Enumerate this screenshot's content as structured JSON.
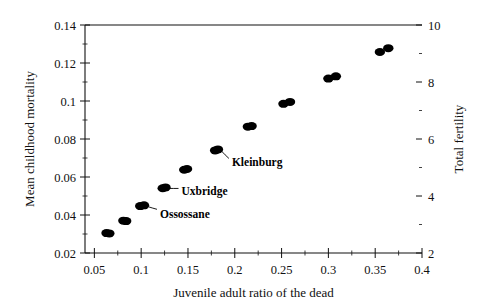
{
  "chart_data": {
    "type": "scatter",
    "title": "",
    "xlabel": "Juvenile adult ratio of the dead",
    "ylabel": "Mean childhood mortality",
    "y2label": "Total fertility",
    "xlim": [
      0.04,
      0.4
    ],
    "ylim": [
      0.02,
      0.14
    ],
    "y2lim": [
      2,
      10
    ],
    "grid": false,
    "legend": "none",
    "xticks": [
      "0.05",
      "0.1",
      "0.15",
      "0.2",
      "0.25",
      "0.3",
      "0.35",
      "0.4"
    ],
    "xtick_values": [
      0.05,
      0.1,
      0.15,
      0.2,
      0.25,
      0.3,
      0.35,
      0.4
    ],
    "yticks": [
      "0.02",
      "0.04",
      "0.06",
      "0.08",
      "0.1",
      "0.12",
      "0.14"
    ],
    "ytick_values": [
      0.02,
      0.04,
      0.06,
      0.08,
      0.1,
      0.12,
      0.14
    ],
    "y2ticks": [
      "2",
      "4",
      "6",
      "8",
      "10"
    ],
    "y2tick_values": [
      2,
      4,
      6,
      8,
      10
    ],
    "series": [
      {
        "name": "sites",
        "points": [
          {
            "x": 0.063,
            "y": 0.0305
          },
          {
            "x": 0.066,
            "y": 0.0303
          },
          {
            "x": 0.081,
            "y": 0.037
          },
          {
            "x": 0.084,
            "y": 0.0368
          },
          {
            "x": 0.099,
            "y": 0.0447
          },
          {
            "x": 0.103,
            "y": 0.0451
          },
          {
            "x": 0.123,
            "y": 0.0541
          },
          {
            "x": 0.126,
            "y": 0.0545
          },
          {
            "x": 0.146,
            "y": 0.0638
          },
          {
            "x": 0.149,
            "y": 0.0642
          },
          {
            "x": 0.179,
            "y": 0.074
          },
          {
            "x": 0.182,
            "y": 0.0745
          },
          {
            "x": 0.214,
            "y": 0.0865
          },
          {
            "x": 0.218,
            "y": 0.0868
          },
          {
            "x": 0.252,
            "y": 0.0985
          },
          {
            "x": 0.259,
            "y": 0.0995
          },
          {
            "x": 0.3,
            "y": 0.1118
          },
          {
            "x": 0.308,
            "y": 0.113
          },
          {
            "x": 0.355,
            "y": 0.1258
          },
          {
            "x": 0.364,
            "y": 0.1278
          }
        ]
      }
    ],
    "annotations": [
      {
        "label": "Ossossane",
        "x": 0.103,
        "y": 0.0451
      },
      {
        "label": "Uxbridge",
        "x": 0.126,
        "y": 0.0545
      },
      {
        "label": "Kleinburg",
        "x": 0.182,
        "y": 0.0745
      }
    ]
  }
}
